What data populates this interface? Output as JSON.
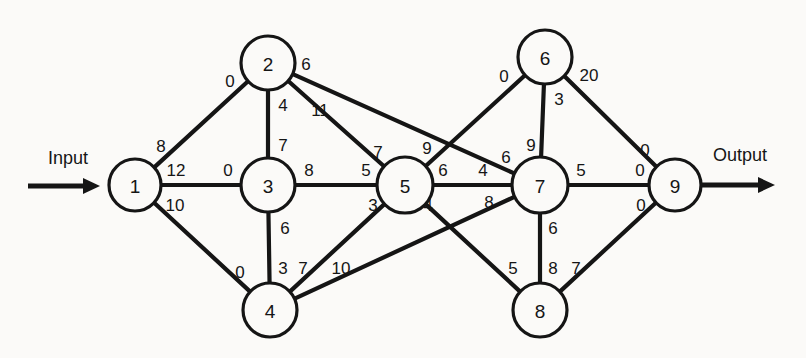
{
  "diagram": {
    "input_label": "Input",
    "output_label": "Output",
    "stroke_color": "#151515",
    "background_color": "#fbfaf8"
  },
  "nodes": [
    {
      "id": "1",
      "label": "1",
      "cx": 135,
      "cy": 185,
      "r": 26
    },
    {
      "id": "2",
      "label": "2",
      "cx": 268,
      "cy": 63,
      "r": 27
    },
    {
      "id": "3",
      "label": "3",
      "cx": 268,
      "cy": 185,
      "r": 27
    },
    {
      "id": "4",
      "label": "4",
      "cx": 270,
      "cy": 310,
      "r": 27
    },
    {
      "id": "5",
      "label": "5",
      "cx": 405,
      "cy": 185,
      "r": 28
    },
    {
      "id": "6",
      "label": "6",
      "cx": 545,
      "cy": 57,
      "r": 27
    },
    {
      "id": "7",
      "label": "7",
      "cx": 540,
      "cy": 185,
      "r": 28
    },
    {
      "id": "8",
      "label": "8",
      "cx": 540,
      "cy": 310,
      "r": 27
    },
    {
      "id": "9",
      "label": "9",
      "cx": 675,
      "cy": 185,
      "r": 26
    }
  ],
  "edges": [
    {
      "name": "edge-1-2",
      "from": "1",
      "to": "2",
      "from_label": "8",
      "to_label": "0",
      "from_label_pos": {
        "x": 161,
        "y": 146
      },
      "to_label_pos": {
        "x": 230,
        "y": 81
      }
    },
    {
      "name": "edge-1-3",
      "from": "1",
      "to": "3",
      "from_label": "12",
      "to_label": "0",
      "from_label_pos": {
        "x": 176,
        "y": 170
      },
      "to_label_pos": {
        "x": 228,
        "y": 170
      }
    },
    {
      "name": "edge-1-4",
      "from": "1",
      "to": "4",
      "from_label": "10",
      "to_label": "0",
      "from_label_pos": {
        "x": 175,
        "y": 205
      },
      "to_label_pos": {
        "x": 240,
        "y": 272
      }
    },
    {
      "name": "edge-2-3",
      "from": "2",
      "to": "3",
      "from_label": "4",
      "to_label": "7",
      "from_label_pos": {
        "x": 283,
        "y": 105
      },
      "to_label_pos": {
        "x": 283,
        "y": 145
      }
    },
    {
      "name": "edge-2-5",
      "from": "2",
      "to": "5",
      "from_label": "11",
      "to_label": "7",
      "from_label_pos": {
        "x": 320,
        "y": 110
      },
      "to_label_pos": {
        "x": 378,
        "y": 152
      }
    },
    {
      "name": "edge-2-7",
      "from": "2",
      "to": "7",
      "from_label": "6",
      "to_label": "6",
      "from_label_pos": {
        "x": 306,
        "y": 64
      },
      "to_label_pos": {
        "x": 506,
        "y": 157
      }
    },
    {
      "name": "edge-3-5",
      "from": "3",
      "to": "5",
      "from_label": "8",
      "to_label": "5",
      "from_label_pos": {
        "x": 309,
        "y": 170
      },
      "to_label_pos": {
        "x": 366,
        "y": 170
      }
    },
    {
      "name": "edge-3-4",
      "from": "3",
      "to": "4",
      "from_label": "6",
      "to_label": "3",
      "from_label_pos": {
        "x": 285,
        "y": 228
      },
      "to_label_pos": {
        "x": 283,
        "y": 268
      }
    },
    {
      "name": "edge-4-5",
      "from": "4",
      "to": "5",
      "from_label": "7",
      "to_label": "3",
      "from_label_pos": {
        "x": 303,
        "y": 268
      },
      "to_label_pos": {
        "x": 373,
        "y": 205
      }
    },
    {
      "name": "edge-4-7",
      "from": "4",
      "to": "7",
      "from_label": "10",
      "to_label": "8",
      "from_label_pos": {
        "x": 341,
        "y": 268
      },
      "to_label_pos": {
        "x": 489,
        "y": 202
      }
    },
    {
      "name": "edge-5-6",
      "from": "5",
      "to": "6",
      "from_label": "9",
      "to_label": "0",
      "from_label_pos": {
        "x": 427,
        "y": 148
      },
      "to_label_pos": {
        "x": 504,
        "y": 76
      }
    },
    {
      "name": "edge-5-7",
      "from": "5",
      "to": "7",
      "from_label": "6",
      "to_label": "4",
      "from_label_pos": {
        "x": 443,
        "y": 170
      },
      "to_label_pos": {
        "x": 483,
        "y": 170
      }
    },
    {
      "name": "edge-5-8",
      "from": "5",
      "to": "8",
      "from_label": "4",
      "to_label": "5",
      "from_label_pos": {
        "x": 428,
        "y": 205
      },
      "to_label_pos": {
        "x": 513,
        "y": 268
      }
    },
    {
      "name": "edge-6-7",
      "from": "6",
      "to": "7",
      "from_label": "3",
      "to_label": "9",
      "from_label_pos": {
        "x": 559,
        "y": 99
      },
      "to_label_pos": {
        "x": 531,
        "y": 145
      }
    },
    {
      "name": "edge-6-9",
      "from": "6",
      "to": "9",
      "from_label": "20",
      "to_label": "0",
      "from_label_pos": {
        "x": 589,
        "y": 75
      },
      "to_label_pos": {
        "x": 645,
        "y": 150
      }
    },
    {
      "name": "edge-7-8",
      "from": "7",
      "to": "8",
      "from_label": "6",
      "to_label": "8",
      "from_label_pos": {
        "x": 553,
        "y": 228
      },
      "to_label_pos": {
        "x": 553,
        "y": 268
      }
    },
    {
      "name": "edge-7-9",
      "from": "7",
      "to": "9",
      "from_label": "5",
      "to_label": "0",
      "from_label_pos": {
        "x": 581,
        "y": 170
      },
      "to_label_pos": {
        "x": 640,
        "y": 170
      }
    },
    {
      "name": "edge-8-9",
      "from": "8",
      "to": "9",
      "from_label": "7",
      "to_label": "0",
      "from_label_pos": {
        "x": 576,
        "y": 268
      },
      "to_label_pos": {
        "x": 641,
        "y": 205
      }
    }
  ],
  "io": {
    "input": {
      "label": "Input",
      "label_pos": {
        "x": 68,
        "y": 158
      },
      "line": {
        "x1": 28,
        "y1": 186,
        "x2": 100,
        "y2": 186
      }
    },
    "output": {
      "label": "Output",
      "label_pos": {
        "x": 740,
        "y": 155
      },
      "line": {
        "x1": 701,
        "y1": 185,
        "x2": 775,
        "y2": 185
      }
    }
  }
}
